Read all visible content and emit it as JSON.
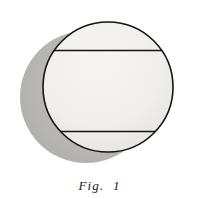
{
  "figure": {
    "caption": "Fig.  1",
    "background_color": "#ffffff"
  },
  "chart_data": {
    "type": "diagram",
    "title": "Fig.  1",
    "shapes": [
      {
        "name": "shadow-circle",
        "kind": "circle",
        "cx": 86,
        "cy": 97,
        "r": 66,
        "fill": "#b6b5b1",
        "stroke": "none"
      },
      {
        "name": "main-circle",
        "kind": "circle",
        "cx": 108,
        "cy": 87,
        "r": 65,
        "fill": "#f0efec",
        "stroke": "#141414",
        "stroke_width": 1.6
      },
      {
        "name": "upper-chord",
        "kind": "line",
        "y": 50,
        "x1": 48,
        "x2": 168,
        "stroke": "#141414",
        "stroke_width": 1.5
      },
      {
        "name": "lower-chord",
        "kind": "line",
        "y": 131,
        "x1": 49,
        "x2": 167,
        "stroke": "#141414",
        "stroke_width": 1.5
      }
    ],
    "xlabel": "",
    "ylabel": "",
    "grid": false,
    "legend": null
  }
}
